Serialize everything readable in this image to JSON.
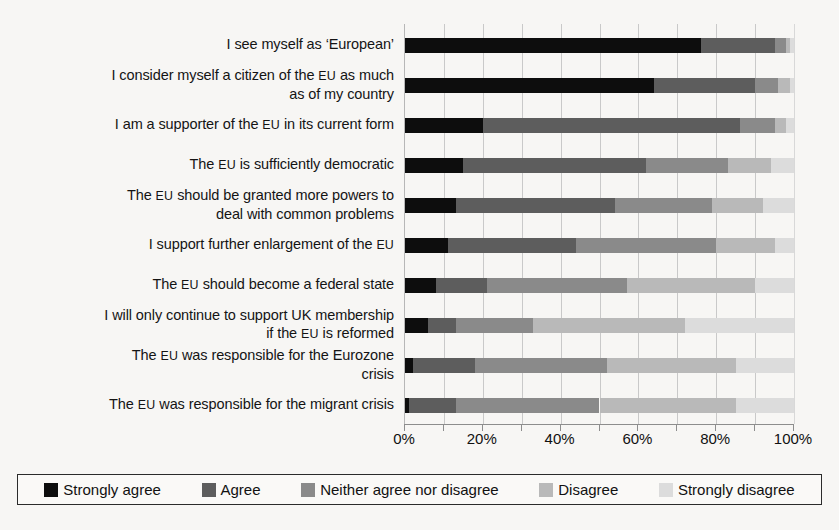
{
  "chart_data": {
    "type": "bar",
    "subtype": "stacked-horizontal-100percent",
    "title": "",
    "xlabel": "",
    "ylabel": "",
    "xlim": [
      0,
      100
    ],
    "xticks": [
      0,
      10,
      20,
      30,
      40,
      50,
      60,
      70,
      80,
      90,
      100
    ],
    "xtick_labels": [
      "0%",
      "",
      "20%",
      "",
      "40%",
      "",
      "60%",
      "",
      "80%",
      "",
      "100%"
    ],
    "grid": true,
    "legend_position": "bottom",
    "categories": [
      "I see myself as ‘European’",
      "I consider myself a citizen of the EU as much\nas of my country",
      "I am a supporter of the EU in its current form",
      "The EU is sufficiently democratic",
      "The EU should be granted more powers to\ndeal with common problems",
      "I support further enlargement of the EU",
      "The EU should become a federal state",
      "I will only continue to support UK membership\nif the EU is reformed",
      "The EU was responsible for the Eurozone\ncrisis",
      "The EU was responsible for the migrant crisis"
    ],
    "series": [
      {
        "name": "Strongly agree",
        "color": "#0d0d0d",
        "values": [
          76,
          64,
          20,
          15,
          13,
          11,
          8,
          6,
          2,
          1
        ]
      },
      {
        "name": "Agree",
        "color": "#5d5d5d",
        "values": [
          19,
          26,
          66,
          47,
          41,
          33,
          13,
          7,
          16,
          12
        ]
      },
      {
        "name": "Neither agree nor disagree",
        "color": "#8a8a8a",
        "values": [
          3,
          6,
          9,
          21,
          25,
          36,
          36,
          20,
          34,
          37
        ]
      },
      {
        "name": "Disagree",
        "color": "#b9b9b9",
        "values": [
          1,
          3,
          3,
          11,
          13,
          15,
          33,
          39,
          33,
          35
        ]
      },
      {
        "name": "Strongly disagree",
        "color": "#dcdcdc",
        "values": [
          1,
          1,
          2,
          6,
          8,
          5,
          10,
          28,
          15,
          15
        ]
      }
    ]
  },
  "legend": {
    "items": [
      {
        "label": "Strongly agree",
        "color": "#0d0d0d"
      },
      {
        "label": "Agree",
        "color": "#5d5d5d"
      },
      {
        "label": "Neither agree nor disagree",
        "color": "#8a8a8a"
      },
      {
        "label": "Disagree",
        "color": "#b9b9b9"
      },
      {
        "label": "Strongly disagree",
        "color": "#dcdcdc"
      }
    ]
  },
  "style": {
    "background": "#f7f6f4",
    "gridline_color": "#c9c9c9",
    "axis_color": "#8d8d8d",
    "text_color": "#141414"
  }
}
